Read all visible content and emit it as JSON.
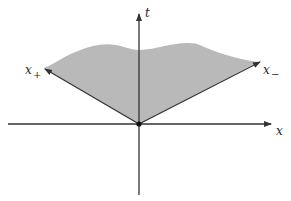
{
  "diagram": {
    "type": "light-cone-region",
    "colors": {
      "background": "#ffffff",
      "region_fill": "#b9b9b9",
      "lines": "#333333"
    },
    "axes": {
      "horizontal_label": "x",
      "vertical_label": "t"
    },
    "rays": {
      "left_label": "x",
      "left_subscript": "+",
      "right_label": "x",
      "right_subscript": "−"
    },
    "origin_point": "origin-dot"
  }
}
